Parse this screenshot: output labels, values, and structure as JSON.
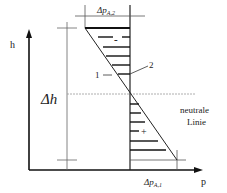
{
  "diagram": {
    "axis_y_label": "h",
    "axis_x_label": "p",
    "delta_h_label": "Δh",
    "top_pressure_label": {
      "main": "Δp",
      "sub": "A,2"
    },
    "bottom_pressure_label": {
      "main": "Δp",
      "sub": "A,1"
    },
    "neutral_line_label_line1": "neutrale",
    "neutral_line_label_line2": "Linie",
    "minus_sign": "-",
    "plus_sign": "+",
    "marker_1": "1",
    "marker_2": "2",
    "colors": {
      "line": "#222222",
      "thin_line": "#555555",
      "dashed": "#888888",
      "background": "#ffffff"
    }
  }
}
